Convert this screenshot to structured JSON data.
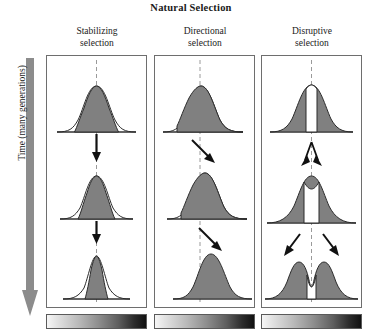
{
  "figure": {
    "title": "Natural Selection",
    "time_axis": {
      "label": "Time (many generations)",
      "direction": "downward",
      "arrow_color": "#8c8c8c"
    },
    "colors": {
      "curve_fill": "#808080",
      "curve_outline": "#2b2b2b",
      "panel_border": "#6e6e6e",
      "arrow": "#111111",
      "dashed_center_line": "#9a9a9a",
      "gradient_start": "#f6f6f6",
      "gradient_end": "#111111"
    },
    "columns": [
      {
        "id": "stabilizing",
        "header_line1": "Stabilizing",
        "header_line2": "selection",
        "gradient_bar": {
          "name": "phenotype-gradient-bar",
          "from": "light",
          "to": "dark"
        },
        "stages": [
          {
            "stage": 1,
            "peak_x": 0,
            "spread": 1.0,
            "peak_height": 1.0,
            "selected_left": -0.62,
            "selected_right": 0.62,
            "shape": "unimodal"
          },
          {
            "stage": 2,
            "peak_x": 0,
            "spread": 0.78,
            "peak_height": 1.0,
            "selected_left": -0.48,
            "selected_right": 0.48,
            "shape": "unimodal"
          },
          {
            "stage": 3,
            "peak_x": 0,
            "spread": 0.55,
            "peak_height": 1.0,
            "selected_left": -0.34,
            "selected_right": 0.34,
            "shape": "unimodal"
          }
        ],
        "arrows": [
          {
            "type": "straight-down",
            "between_stages": "1-2"
          },
          {
            "type": "straight-down",
            "between_stages": "2-3"
          }
        ]
      },
      {
        "id": "directional",
        "header_line1": "Directional",
        "header_line2": "selection",
        "gradient_bar": {
          "name": "phenotype-gradient-bar",
          "from": "light",
          "to": "dark"
        },
        "stages": [
          {
            "stage": 1,
            "peak_x": -0.05,
            "spread": 1.0,
            "peak_height": 1.0,
            "selected_left": -0.72,
            "selected_right": 1.6,
            "shape": "unimodal"
          },
          {
            "stage": 2,
            "peak_x": 0.22,
            "spread": 1.0,
            "peak_height": 1.0,
            "selected_left": -0.62,
            "selected_right": 1.8,
            "shape": "unimodal"
          },
          {
            "stage": 3,
            "peak_x": 0.62,
            "spread": 1.0,
            "peak_height": 1.0,
            "selected_left": -0.5,
            "selected_right": 2.0,
            "shape": "unimodal"
          }
        ],
        "arrows": [
          {
            "type": "diagonal-down-right",
            "between_stages": "1-2"
          },
          {
            "type": "diagonal-down-right",
            "between_stages": "2-3"
          }
        ]
      },
      {
        "id": "disruptive",
        "header_line1": "Disruptive",
        "header_line2": "selection",
        "gradient_bar": {
          "name": "phenotype-gradient-bar",
          "from": "light",
          "to": "dark"
        },
        "stages": [
          {
            "stage": 1,
            "peak_x": 0,
            "spread": 1.0,
            "peak_height": 1.0,
            "notch_half_width": 0.14,
            "notch_depth": 0.0,
            "shape": "unimodal-with-center-gap"
          },
          {
            "stage": 2,
            "peak_x": 0,
            "spread": 1.1,
            "peak_height": 1.0,
            "notch_half_width": 0.2,
            "notch_depth": 0.18,
            "shape": "notched"
          },
          {
            "stage": 3,
            "peak_x": 0,
            "spread": 1.2,
            "peak_height": 1.0,
            "notch_half_width": 0.26,
            "notch_depth": 0.62,
            "shape": "bimodal",
            "mode_offsets": [
              -0.62,
              0.62
            ]
          }
        ],
        "arrows": [
          {
            "type": "diverging-up-y",
            "between_stages": "1-2"
          },
          {
            "type": "diverging-down-pair",
            "between_stages": "2-3"
          }
        ]
      }
    ]
  }
}
